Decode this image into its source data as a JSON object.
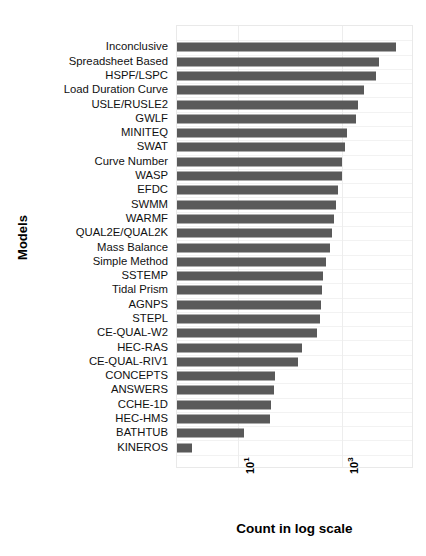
{
  "chart_data": {
    "type": "bar",
    "orientation": "horizontal",
    "title": "",
    "xlabel": "Count in log scale",
    "ylabel": "Models",
    "xscale": "log",
    "xlim": [
      1,
      20000
    ],
    "grid": true,
    "legend": null,
    "bar_color": "#595959",
    "background_color": "#ffffff",
    "xticks": [
      {
        "label": "10",
        "exponent": "1",
        "value": 10
      },
      {
        "label": "10",
        "exponent": "3",
        "value": 1000
      }
    ],
    "categories": [
      "Inconclusive",
      "Spreadsheet Based",
      "HSPF/LSPC",
      "Load Duration Curve",
      "USLE/RUSLE2",
      "GWLF",
      "MINITEQ",
      "SWAT",
      "Curve Number",
      "WASP",
      "EFDC",
      "SWMM",
      "WARMF",
      "QUAL2E/QUAL2K",
      "Mass Balance",
      "Simple Method",
      "SSTEMP",
      "Tidal Prism",
      "AGNPS",
      "STEPL",
      "CE-QUAL-W2",
      "HEC-RAS",
      "CE-QUAL-RIV1",
      "CONCEPTS",
      "ANSWERS",
      "CCHE-1D",
      "HEC-HMS",
      "BATHTUB",
      "KINEROS"
    ],
    "values": [
      11000,
      5200,
      4500,
      2600,
      2000,
      1900,
      1250,
      1150,
      1000,
      980,
      820,
      760,
      700,
      640,
      600,
      500,
      430,
      420,
      400,
      370,
      330,
      170,
      140,
      52,
      50,
      43,
      42,
      13,
      1.3
    ]
  }
}
